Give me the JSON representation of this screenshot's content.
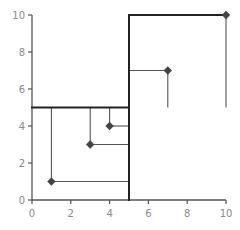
{
  "chart_data": {
    "type": "scatter",
    "title": "",
    "xlabel": "",
    "ylabel": "",
    "xlim": [
      0,
      10
    ],
    "ylim": [
      0,
      10
    ],
    "grid": false,
    "x_ticks": [
      0,
      2,
      4,
      6,
      8,
      10
    ],
    "y_ticks": [
      0,
      2,
      4,
      6,
      8,
      10
    ],
    "x_tick_labels": [
      "0",
      "2",
      "4",
      "6",
      "8",
      "10"
    ],
    "y_tick_labels": [
      "0",
      "2",
      "4",
      "6",
      "8",
      "10"
    ],
    "points": [
      {
        "x": 1,
        "y": 1
      },
      {
        "x": 3,
        "y": 3
      },
      {
        "x": 4,
        "y": 4
      },
      {
        "x": 7,
        "y": 7
      },
      {
        "x": 10,
        "y": 10
      }
    ],
    "marker": "diamond",
    "quadrant_split": {
      "x": 5,
      "y": 5
    },
    "quadrant_lines": [
      {
        "x1": 0,
        "y1": 5,
        "x2": 5,
        "y2": 5
      },
      {
        "x1": 5,
        "y1": 0,
        "x2": 5,
        "y2": 10
      },
      {
        "x1": 5,
        "y1": 10,
        "x2": 10,
        "y2": 10
      }
    ],
    "connectors": [
      {
        "point": [
          1,
          1
        ],
        "lines": [
          {
            "x1": 1,
            "y1": 1,
            "x2": 1,
            "y2": 5
          },
          {
            "x1": 1,
            "y1": 1,
            "x2": 5,
            "y2": 1
          }
        ]
      },
      {
        "point": [
          3,
          3
        ],
        "lines": [
          {
            "x1": 3,
            "y1": 3,
            "x2": 3,
            "y2": 5
          },
          {
            "x1": 3,
            "y1": 3,
            "x2": 5,
            "y2": 3
          }
        ]
      },
      {
        "point": [
          4,
          4
        ],
        "lines": [
          {
            "x1": 4,
            "y1": 4,
            "x2": 4,
            "y2": 5
          },
          {
            "x1": 4,
            "y1": 4,
            "x2": 5,
            "y2": 4
          }
        ]
      },
      {
        "point": [
          7,
          7
        ],
        "lines": [
          {
            "x1": 5,
            "y1": 7,
            "x2": 7,
            "y2": 7
          },
          {
            "x1": 7,
            "y1": 7,
            "x2": 7,
            "y2": 5
          }
        ]
      },
      {
        "point": [
          10,
          10
        ],
        "lines": [
          {
            "x1": 10,
            "y1": 10,
            "x2": 10,
            "y2": 5
          }
        ]
      }
    ]
  },
  "colors": {
    "axis": "#555555",
    "tick_label": "#8a8a8a",
    "quadrant_line": "#222222",
    "connector": "#555555",
    "marker": "#444444"
  }
}
